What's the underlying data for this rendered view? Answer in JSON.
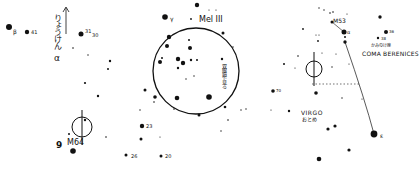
{
  "chart": {
    "panels": [
      {
        "id": "left",
        "labels": {
          "beta": "β",
          "star41": "41",
          "star31": "31",
          "star30": "30",
          "constellation_vertical": "りょうけん",
          "alpha": "α",
          "m64": "M64",
          "nine": "9"
        }
      },
      {
        "id": "center",
        "labels": {
          "gamma": "γ",
          "mel111": "Mel III",
          "binocular_note": "双眼鏡で見る",
          "star23": "23",
          "star26": "26",
          "star20": "20"
        }
      },
      {
        "id": "right",
        "labels": {
          "m53": "M53",
          "alpha": "α",
          "star36": "36",
          "star38": "38",
          "coma_jp": "かみのけ座",
          "coma": "COMA BERENICES",
          "virgo": "VIRGO",
          "virgo_jp": "おとめ",
          "star70": "70",
          "epsilon": "ε"
        }
      }
    ],
    "colors": {
      "ink": "#111111",
      "paper": "#ffffff"
    }
  }
}
